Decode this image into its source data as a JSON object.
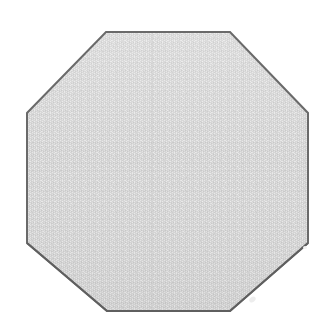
{
  "canvas": {
    "width": 320,
    "height": 331,
    "background_color": "#ffffff"
  },
  "figure": {
    "name": "octagon",
    "shape_type": "regular octagon",
    "sides": 8,
    "alt_text": "Regular octagon",
    "fill_color": "#d2d2d2",
    "fill_texture": "fine dithered halftone noise",
    "stroke_color": "#6a6a6a",
    "stroke_width_px": 2,
    "vertices": [
      {
        "label": "top-left",
        "x": 106,
        "y": 32
      },
      {
        "label": "top-right",
        "x": 230,
        "y": 32
      },
      {
        "label": "right-top",
        "x": 308,
        "y": 113
      },
      {
        "label": "right-bottom",
        "x": 308,
        "y": 243
      },
      {
        "label": "bottom-right",
        "x": 230,
        "y": 311
      },
      {
        "label": "bottom-left",
        "x": 107,
        "y": 311
      },
      {
        "label": "left-bottom",
        "x": 27,
        "y": 243
      },
      {
        "label": "left-top",
        "x": 27,
        "y": 113
      }
    ],
    "bounding_box": {
      "x": 27,
      "y": 32,
      "width": 281,
      "height": 279
    },
    "center": {
      "x": 167,
      "y": 171
    }
  },
  "texture": {
    "dot_color_light": "#e4e4e4",
    "dot_color_dark": "#c2c2c2",
    "tile_size_px": 4
  },
  "artifacts": [
    {
      "name": "smudge-bottom-right",
      "color": "#ededed"
    },
    {
      "name": "speck-right",
      "color": "#f2f2f2"
    }
  ]
}
